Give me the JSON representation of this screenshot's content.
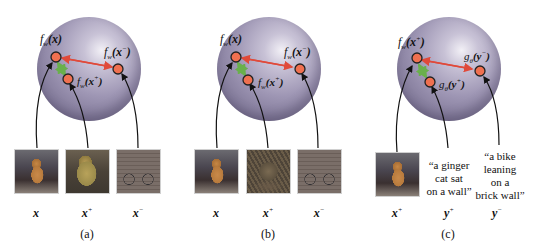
{
  "colors": {
    "sphere": "#9e96b4",
    "point_fill": "#f07050",
    "point_stroke": "#222222",
    "repel_arrow": "#e04a3a",
    "attract_arrow": "#6ab04c",
    "connector": "#111111"
  },
  "panels": [
    {
      "id": "a",
      "caption": "(a)",
      "points": {
        "anchor": {
          "f": "f",
          "sub": "w",
          "arg": "(x)",
          "argsup": ""
        },
        "negative": {
          "f": "f",
          "sub": "w",
          "arg": "(x",
          "argsup": "−",
          "close": ")"
        },
        "positive": {
          "f": "f",
          "sub": "w",
          "arg": "(x",
          "argsup": "+",
          "close": ")"
        }
      },
      "inputs": [
        {
          "kind": "image",
          "desc": "ginger cat sitting",
          "var": "x",
          "sup": ""
        },
        {
          "kind": "image",
          "desc": "ginger cat close-up",
          "var": "x",
          "sup": "+"
        },
        {
          "kind": "image",
          "desc": "bicycle against brick wall",
          "var": "x",
          "sup": "−"
        }
      ]
    },
    {
      "id": "b",
      "caption": "(b)",
      "points": {
        "anchor": {
          "f": "f",
          "sub": "w",
          "arg": "(x)",
          "argsup": ""
        },
        "negative": {
          "f": "f",
          "sub": "w",
          "arg": "(x",
          "argsup": "−",
          "close": ")"
        },
        "positive": {
          "f": "f",
          "sub": "w",
          "arg": "(x",
          "argsup": "+",
          "close": ")"
        }
      },
      "inputs": [
        {
          "kind": "image",
          "desc": "ginger cat sitting",
          "var": "x",
          "sup": ""
        },
        {
          "kind": "image",
          "desc": "tabby cat lying",
          "var": "x",
          "sup": "+"
        },
        {
          "kind": "image",
          "desc": "bicycle against brick wall",
          "var": "x",
          "sup": "−"
        }
      ]
    },
    {
      "id": "c",
      "caption": "(c)",
      "points": {
        "anchor": {
          "f": "f",
          "sub": "w",
          "arg": "(x",
          "argsup": "+",
          "close": ")"
        },
        "negative": {
          "f": "g",
          "sub": "θ",
          "arg": "(y",
          "argsup": "−",
          "close": ")"
        },
        "positive": {
          "f": "g",
          "sub": "θ",
          "arg": "(y",
          "argsup": "+",
          "close": ")"
        }
      },
      "inputs": [
        {
          "kind": "image",
          "desc": "ginger cat sitting",
          "var": "x",
          "sup": "+"
        },
        {
          "kind": "text",
          "text": "“a ginger\ncat sat\non a wall”",
          "var": "y",
          "sup": "+"
        },
        {
          "kind": "text",
          "text": "“a bike\nleaning\non a\nbrick wall”",
          "var": "y",
          "sup": "−"
        }
      ]
    }
  ]
}
